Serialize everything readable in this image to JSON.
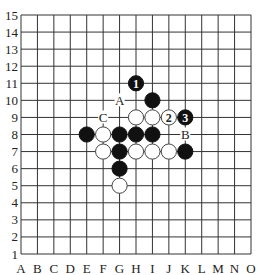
{
  "board": {
    "size": 15,
    "columns": [
      "A",
      "B",
      "C",
      "D",
      "E",
      "F",
      "G",
      "H",
      "I",
      "J",
      "K",
      "L",
      "M",
      "N",
      "O"
    ],
    "rows": [
      "1",
      "2",
      "3",
      "4",
      "5",
      "6",
      "7",
      "8",
      "9",
      "10",
      "11",
      "12",
      "13",
      "14",
      "15"
    ],
    "colors": {
      "line": "#333333",
      "black": "#111111",
      "white": "#ffffff",
      "label": "#222222"
    },
    "stones": [
      {
        "pos": "H11",
        "color": "black",
        "number": "1"
      },
      {
        "pos": "I10",
        "color": "black"
      },
      {
        "pos": "H9",
        "color": "white"
      },
      {
        "pos": "I9",
        "color": "white"
      },
      {
        "pos": "J9",
        "color": "white",
        "number": "2"
      },
      {
        "pos": "K9",
        "color": "black",
        "number": "3"
      },
      {
        "pos": "E8",
        "color": "black"
      },
      {
        "pos": "F8",
        "color": "white"
      },
      {
        "pos": "G8",
        "color": "black"
      },
      {
        "pos": "H8",
        "color": "black"
      },
      {
        "pos": "I8",
        "color": "black"
      },
      {
        "pos": "F7",
        "color": "white"
      },
      {
        "pos": "G7",
        "color": "black"
      },
      {
        "pos": "H7",
        "color": "white"
      },
      {
        "pos": "I7",
        "color": "white"
      },
      {
        "pos": "J7",
        "color": "white"
      },
      {
        "pos": "K7",
        "color": "black"
      },
      {
        "pos": "G6",
        "color": "black"
      },
      {
        "pos": "G5",
        "color": "white"
      }
    ],
    "markers": [
      {
        "pos": "G10",
        "text": "A"
      },
      {
        "pos": "K8",
        "text": "B"
      },
      {
        "pos": "F9",
        "text": "C"
      }
    ]
  }
}
